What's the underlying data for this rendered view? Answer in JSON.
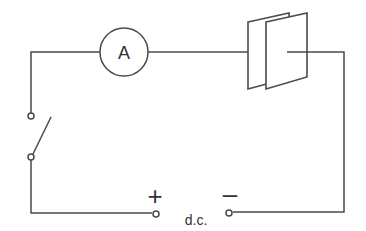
{
  "diagram": {
    "ammeter_label": "A",
    "positive_sign": "+",
    "negative_sign": "–",
    "supply_label": "d.c.",
    "stroke_color": "#4a4a4a"
  }
}
